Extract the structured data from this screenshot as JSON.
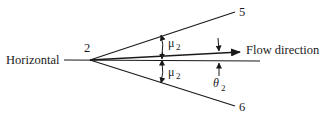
{
  "diagram": {
    "type": "oblique-shock / expansion wave geometry",
    "labels": {
      "horizontal": "Horizontal",
      "vertex": "2",
      "upper_line": "5",
      "lower_line": "6",
      "flow": "Flow direction",
      "mu_upper": "μ",
      "mu_upper_sub": "2",
      "mu_lower": "μ",
      "mu_lower_sub": "2",
      "theta": "θ",
      "theta_sub": "2"
    },
    "colors": {
      "ink": "#1a1a1a",
      "background": "#ffffff"
    }
  }
}
